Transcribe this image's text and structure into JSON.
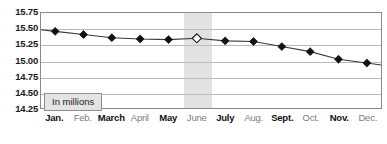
{
  "chart_data": {
    "type": "line",
    "title": "",
    "subtitle": "",
    "xlabel": "",
    "ylabel": "",
    "annotation": "In millions",
    "units_note": "In millions",
    "grid": true,
    "legend": "none",
    "ylim": [
      14.25,
      15.75
    ],
    "ytick_step": 0.25,
    "yticks": [
      "15.75",
      "15.50",
      "15.25",
      "15.00",
      "14.75",
      "14.50",
      "14.25"
    ],
    "ytick_values": [
      15.75,
      15.5,
      15.25,
      15.0,
      14.75,
      14.5,
      14.25
    ],
    "categories": [
      "Jan.",
      "Feb.",
      "March",
      "April",
      "May",
      "June",
      "July",
      "Aug.",
      "Sept.",
      "Oct.",
      "Nov.",
      "Dec."
    ],
    "values": [
      15.46,
      15.41,
      15.36,
      15.34,
      15.33,
      15.35,
      15.31,
      15.3,
      15.22,
      15.14,
      15.02,
      14.96
    ],
    "highlight_category": "June",
    "highlight_index": 5,
    "marker_styles": [
      "closed",
      "closed",
      "closed",
      "closed",
      "closed",
      "open",
      "closed",
      "closed",
      "closed",
      "closed",
      "closed",
      "closed"
    ],
    "x_label_emphasis": [
      "strong",
      "muted",
      "strong",
      "muted",
      "strong",
      "muted",
      "strong",
      "muted",
      "strong",
      "muted",
      "strong",
      "muted"
    ],
    "colors": {
      "line": "#3a3a3a",
      "marker_fill": "#111111",
      "marker_open_fill": "#ffffff",
      "gridline": "#b9b9b9",
      "frame": "#8a8a8a",
      "highlight_band": "#e2e2e2",
      "annotation_bg": "#e4e4e4",
      "annotation_border": "#8f8f8f",
      "label_strong": "#111111",
      "label_muted": "#7d7d7d",
      "background": "#ffffff"
    }
  }
}
